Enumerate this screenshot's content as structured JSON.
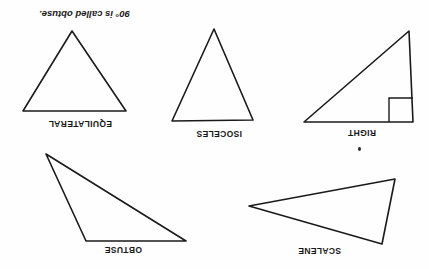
{
  "document": {
    "orientation": "upside-down-scan",
    "rotation_degrees": 180,
    "background_color": "#fefefe",
    "ink_color": "#1a1a1a",
    "page_width": 429,
    "page_height": 269
  },
  "figures": [
    {
      "id": "scalene",
      "label": "SCALENE",
      "kind": "triangle",
      "vertices": [
        [
          47,
          25
        ],
        [
          180,
          63
        ],
        [
          34,
          90
        ]
      ],
      "has_right_angle_mark": false
    },
    {
      "id": "obtuse",
      "label": "OBTUSE",
      "kind": "triangle",
      "vertices": [
        [
          28,
          28
        ],
        [
          128,
          28
        ],
        [
          168,
          115
        ]
      ],
      "has_right_angle_mark": false
    },
    {
      "id": "right",
      "label": "RIGHT",
      "kind": "triangle",
      "vertices": [
        [
          16,
          19
        ],
        [
          125,
          19
        ],
        [
          20,
          110
        ]
      ],
      "has_right_angle_mark": true
    },
    {
      "id": "isoceles",
      "label": "ISOCELES",
      "kind": "triangle",
      "vertices": [
        [
          31,
          21
        ],
        [
          112,
          20
        ],
        [
          70,
          112
        ]
      ],
      "has_right_angle_mark": false
    },
    {
      "id": "equilateral",
      "label": "EQUILATERAL",
      "kind": "triangle",
      "vertices": [
        [
          18,
          30
        ],
        [
          121,
          30
        ],
        [
          72,
          110
        ]
      ],
      "has_right_angle_mark": false
    }
  ],
  "caption": {
    "obtuse_note": "90° is called obtuse."
  },
  "artifacts": {
    "scan_speck": "scan-speck"
  }
}
